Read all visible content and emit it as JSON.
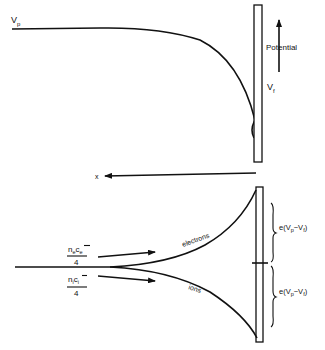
{
  "diagram": {
    "type": "langmuir-probe-floating-potential",
    "colors": {
      "ink": "#111111",
      "background": "#ffffff"
    },
    "top_panel": {
      "curve_start_label": "V",
      "curve_start_sub": "p",
      "curve_end_label": "V",
      "curve_end_sub": "f",
      "axis_arrow_label": "Potential"
    },
    "x_axis": {
      "label": "x"
    },
    "bottom_panel": {
      "flux_electrons": {
        "num_n": "n",
        "num_n_sub": "e",
        "num_c": "c",
        "num_c_sub": "e",
        "den": "4"
      },
      "flux_ions": {
        "num_n": "n",
        "num_n_sub": "i",
        "num_c": "c",
        "num_c_sub": "i",
        "den": "4"
      },
      "electrons_label": "electrons",
      "ions_label": "ions",
      "brace_upper": {
        "prefix": "e(V",
        "sub1": "p",
        "mid": "−V",
        "sub2": "f",
        "suffix": ")"
      },
      "brace_lower": {
        "prefix": "e(V",
        "sub1": "p",
        "mid": "−V",
        "sub2": "f",
        "suffix": ")"
      }
    }
  }
}
